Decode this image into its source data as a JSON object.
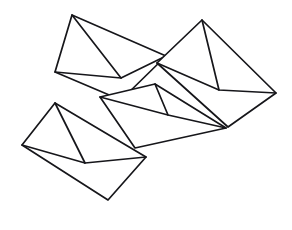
{
  "artwork": {
    "title": "Scattered Envelopes Line Drawing",
    "description": "Black-and-white line art of four overlapping mail envelopes at varied angles on a white background",
    "subject": "envelopes",
    "style": "line-art-outline",
    "canvas": {
      "width": 292,
      "height": 230
    },
    "colors": {
      "background": "#ffffff",
      "stroke": "#16161a",
      "fill": "#ffffff"
    },
    "stroke_width": 1.7,
    "envelope_count": 4,
    "envelopes": [
      {
        "id": "envelope-top-left",
        "label": "Top-left envelope",
        "rotation_deg": -18,
        "body_points": "72,15 166,56 121,100 55,72",
        "flap_points": "55,72 121,78 166,56",
        "flap_extra": "72,15 121,78"
      },
      {
        "id": "envelope-top-right",
        "label": "Top-right envelope",
        "rotation_deg": 14,
        "body_points": "202,20 276,93 228,127 157,63",
        "flap_points": "157,63 219,90 276,93",
        "flap_extra": "202,20 219,90"
      },
      {
        "id": "envelope-middle",
        "label": "Middle envelope",
        "rotation_deg": 8,
        "body_points": "155,84 226,128 135,148 100,97",
        "flap_points": "100,97 168,115 226,128",
        "flap_extra": "155,84 168,115"
      },
      {
        "id": "envelope-bottom-left",
        "label": "Bottom-left envelope",
        "rotation_deg": 22,
        "body_points": "55,103 146,157 108,200 22,145",
        "flap_points": "22,145 85,163 146,157",
        "flap_extra": "55,103 85,163"
      }
    ]
  }
}
